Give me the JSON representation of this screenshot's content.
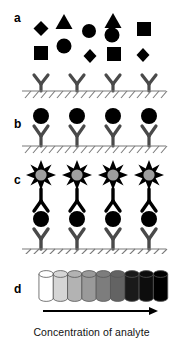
{
  "figure": {
    "type": "immunoassay-schematic",
    "caption": "Concentration of analyte",
    "background_color": "#ffffff"
  },
  "panels": [
    {
      "id": "a",
      "label": "a",
      "label_x": 14,
      "label_y": 12,
      "description": "Mixed sample molecules above capture antibodies on surface",
      "capture_antibody_count": 4,
      "analyte_shapes": [
        {
          "shape": "diamond",
          "x": 41,
          "y": 28,
          "size": 13
        },
        {
          "shape": "triangle",
          "x": 64,
          "y": 21,
          "size": 15
        },
        {
          "shape": "circle",
          "x": 89,
          "y": 30,
          "size": 13
        },
        {
          "shape": "triangle",
          "x": 113,
          "y": 21,
          "size": 15
        },
        {
          "shape": "circle",
          "x": 112,
          "y": 33,
          "size": 13
        },
        {
          "shape": "square",
          "x": 144,
          "y": 28,
          "size": 13
        },
        {
          "shape": "square",
          "x": 41,
          "y": 52,
          "size": 13
        },
        {
          "shape": "circle",
          "x": 64,
          "y": 45,
          "size": 13
        },
        {
          "shape": "diamond",
          "x": 90,
          "y": 55,
          "size": 12
        },
        {
          "shape": "square",
          "x": 114,
          "y": 52,
          "size": 13
        },
        {
          "shape": "diamond",
          "x": 143,
          "y": 54,
          "size": 12
        }
      ]
    },
    {
      "id": "b",
      "label": "b",
      "label_x": 14,
      "label_y": 118,
      "description": "Analyte captured by surface antibodies",
      "capture_antibody_count": 4,
      "analyte_bound": true
    },
    {
      "id": "c",
      "label": "c",
      "label_x": 14,
      "label_y": 172,
      "description": "Sandwich complex with labelled detection antibody",
      "capture_antibody_count": 4,
      "detection_antibody_count": 4,
      "label_marker": "enzyme-burst"
    },
    {
      "id": "d",
      "label": "d",
      "label_x": 14,
      "label_y": 283,
      "description": "Colorimetric readout wells, increasing signal",
      "well_count": 9,
      "well_shades": [
        "#ffffff",
        "#d5d5d5",
        "#b3b3b3",
        "#9a9a9a",
        "#7d7d7d",
        "#636363",
        "#1a1a1a",
        "#0d0d0d",
        "#000000"
      ]
    }
  ],
  "colors": {
    "analyte_fill": "#000000",
    "antibody_stroke": "#4a4a4a",
    "surface_line": "#7a7a7a",
    "enzyme_fill": "#9e9e9e",
    "enzyme_stroke": "#000000",
    "well_outline": "#555555",
    "arrow": "#000000",
    "text": "#000000"
  },
  "arrow": {
    "name": "concentration-arrow",
    "direction": "right",
    "x_start": 43,
    "x_end": 158,
    "y": 311
  }
}
